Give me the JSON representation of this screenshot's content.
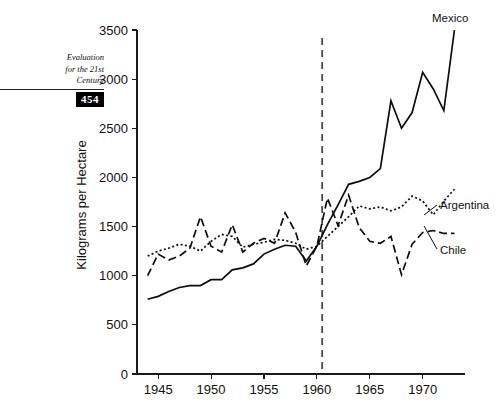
{
  "margin_head": {
    "line1": "Evaluation",
    "line2": "for the 21st",
    "line3": "Century",
    "page_number": "454"
  },
  "chart_data": {
    "type": "line",
    "title": "",
    "xlabel": "",
    "ylabel": "Kilograms per Hectare",
    "xlim": [
      1943,
      1974
    ],
    "ylim": [
      0,
      3500
    ],
    "grid": false,
    "legend_position": "inline-right",
    "x_ticks": [
      1945,
      1950,
      1955,
      1960,
      1965,
      1970
    ],
    "x_tick_labels": [
      "1945",
      "1950",
      "1955",
      "1960",
      "1965",
      "1970"
    ],
    "y_ticks": [
      0,
      500,
      1000,
      1500,
      2000,
      2500,
      3000,
      3500
    ],
    "y_tick_labels": [
      "0",
      "500",
      "1000",
      "1500",
      "2000",
      "2500",
      "3000",
      "3500"
    ],
    "annotations": [
      {
        "name": "reference-line",
        "type": "vline",
        "x": 1960.5,
        "style": "dashed",
        "color": "#4a4a4a"
      }
    ],
    "series": [
      {
        "name": "Mexico",
        "style": "solid",
        "color": "#0d0d0d",
        "x": [
          1944,
          1945,
          1946,
          1947,
          1948,
          1949,
          1950,
          1951,
          1952,
          1953,
          1954,
          1955,
          1956,
          1957,
          1958,
          1959,
          1960,
          1961,
          1962,
          1963,
          1964,
          1965,
          1966,
          1967,
          1968,
          1969,
          1970,
          1971,
          1972,
          1973
        ],
        "y": [
          760,
          790,
          840,
          880,
          900,
          900,
          960,
          960,
          1060,
          1080,
          1120,
          1220,
          1270,
          1310,
          1300,
          1150,
          1300,
          1520,
          1720,
          1930,
          1960,
          2000,
          2090,
          2780,
          2500,
          2660,
          3070,
          2900,
          2680,
          3500
        ]
      },
      {
        "name": "Argentina",
        "style": "dotted",
        "color": "#0d0d0d",
        "x": [
          1944,
          1945,
          1946,
          1947,
          1948,
          1949,
          1950,
          1951,
          1952,
          1953,
          1954,
          1955,
          1956,
          1957,
          1958,
          1959,
          1960,
          1961,
          1962,
          1963,
          1964,
          1965,
          1966,
          1967,
          1968,
          1969,
          1970,
          1971,
          1972,
          1973
        ],
        "y": [
          1200,
          1250,
          1280,
          1320,
          1300,
          1250,
          1350,
          1420,
          1400,
          1290,
          1320,
          1340,
          1370,
          1360,
          1330,
          1270,
          1300,
          1400,
          1500,
          1600,
          1710,
          1680,
          1700,
          1660,
          1700,
          1810,
          1760,
          1620,
          1760,
          1880
        ]
      },
      {
        "name": "Chile",
        "style": "dashed",
        "color": "#0d0d0d",
        "x": [
          1944,
          1945,
          1946,
          1947,
          1948,
          1949,
          1950,
          1951,
          1952,
          1953,
          1954,
          1955,
          1956,
          1957,
          1958,
          1959,
          1960,
          1961,
          1962,
          1963,
          1964,
          1965,
          1966,
          1967,
          1968,
          1969,
          1970,
          1971,
          1972,
          1973
        ],
        "y": [
          1000,
          1220,
          1160,
          1200,
          1280,
          1600,
          1300,
          1240,
          1520,
          1240,
          1330,
          1380,
          1330,
          1640,
          1440,
          1100,
          1300,
          1790,
          1510,
          1820,
          1490,
          1350,
          1330,
          1400,
          1010,
          1320,
          1440,
          1460,
          1430,
          1430
        ]
      }
    ]
  }
}
